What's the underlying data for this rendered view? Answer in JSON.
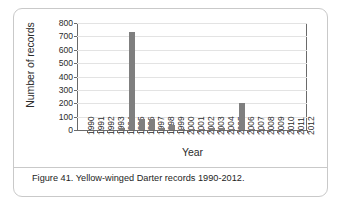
{
  "figure": {
    "caption": "Figure 41. Yellow-winged Darter records 1990-2012."
  },
  "chart_data": {
    "type": "bar",
    "title": "",
    "xlabel": "Year",
    "ylabel": "Number of records",
    "categories": [
      "1990",
      "1991",
      "1992",
      "1993",
      "1994",
      "1995",
      "1996",
      "1997",
      "1998",
      "1999",
      "2000",
      "2001",
      "2002",
      "2003",
      "2004",
      "2005",
      "2006",
      "2007",
      "2008",
      "2009",
      "2010",
      "2011",
      "2012"
    ],
    "values": [
      0,
      0,
      0,
      0,
      15,
      735,
      80,
      80,
      12,
      38,
      3,
      2,
      2,
      12,
      13,
      5,
      205,
      6,
      2,
      0,
      0,
      0,
      0
    ],
    "ylim": [
      0,
      800
    ],
    "ytick_labels": [
      "0",
      "100",
      "200",
      "300",
      "400",
      "500",
      "600",
      "700",
      "800"
    ],
    "ytick_values": [
      0,
      100,
      200,
      300,
      400,
      500,
      600,
      700,
      800
    ],
    "grid": true,
    "legend": null,
    "bar_color": "#7f7f7f",
    "axis_color": "#6a6a6a",
    "grid_color": "#e3e3e3"
  }
}
